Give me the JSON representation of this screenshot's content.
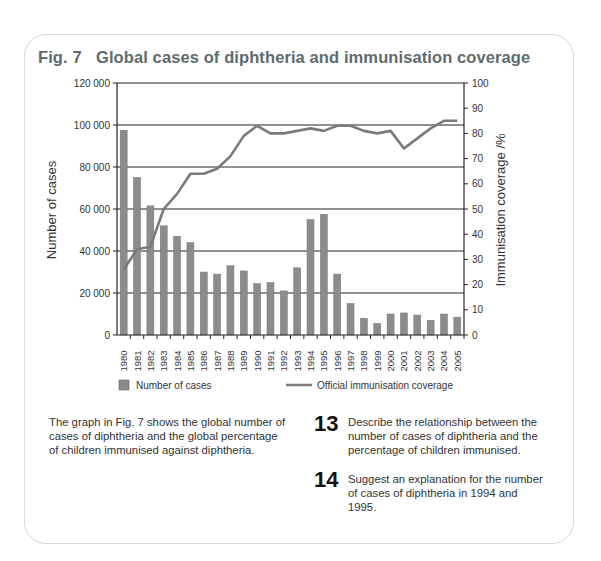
{
  "figure": {
    "label": "Fig. 7",
    "title": "Global cases of diphtheria and immunisation coverage"
  },
  "chart_data": {
    "type": "bar+line",
    "title": "Global cases of diphtheria and immunisation coverage",
    "categories": [
      "1980",
      "1981",
      "1982",
      "1983",
      "1984",
      "1985",
      "1986",
      "1987",
      "1988",
      "1989",
      "1990",
      "1991",
      "1992",
      "1993",
      "1994",
      "1995",
      "1996",
      "1997",
      "1998",
      "1999",
      "2000",
      "2001",
      "2002",
      "2003",
      "2004",
      "2005"
    ],
    "series": [
      {
        "name": "Number of cases",
        "type": "bar",
        "axis": "left",
        "color": "#8c8c8c",
        "values": [
          97500,
          75000,
          61500,
          52000,
          47000,
          44000,
          30000,
          29000,
          33000,
          30500,
          24500,
          25000,
          21000,
          32000,
          55000,
          57500,
          29000,
          15000,
          8000,
          5500,
          10000,
          10500,
          9500,
          7000,
          10000,
          8500
        ]
      },
      {
        "name": "Official immunisation coverage",
        "type": "line",
        "axis": "right",
        "color": "#7a7a7a",
        "values": [
          26,
          34,
          35,
          50,
          56,
          64,
          64,
          66,
          71,
          79,
          83,
          80,
          80,
          81,
          82,
          81,
          83,
          83,
          81,
          80,
          81,
          74,
          78,
          82,
          85,
          85
        ]
      }
    ],
    "xlabel": "",
    "ylabel": "Number of cases",
    "ylabel_right": "Immunisation coverage /%",
    "ylim": [
      0,
      120000
    ],
    "ylim_right": [
      0,
      100
    ],
    "yticks": [
      "0",
      "20 000",
      "40 000",
      "60 000",
      "80 000",
      "100 000",
      "120 000"
    ],
    "yticks_right": [
      "0",
      "10",
      "20",
      "30",
      "40",
      "50",
      "60",
      "70",
      "80",
      "90",
      "100"
    ],
    "grid": "horizontal at left-axis ticks",
    "legend": {
      "position": "bottom",
      "entries": [
        "Number of cases",
        "Official immunisation coverage"
      ]
    }
  },
  "text": {
    "intro": "The graph in Fig. 7 shows the global number of cases of diphtheria and the global percentage of children immunised against diphtheria.",
    "questions": [
      {
        "number": "13",
        "text": "Describe the relationship between the number of cases of diphtheria and the percentage of children immunised."
      },
      {
        "number": "14",
        "text": "Suggest an explanation for the number of cases of diphtheria in 1994 and 1995."
      }
    ]
  }
}
